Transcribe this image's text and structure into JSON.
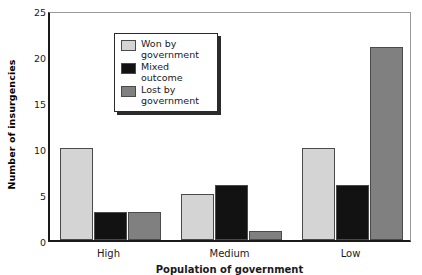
{
  "chart_data": {
    "type": "bar",
    "title": "",
    "xlabel": "Population of government",
    "ylabel": "Number of insurgencies",
    "categories": [
      "High",
      "Medium",
      "Low"
    ],
    "series": [
      {
        "name": "Won by government",
        "values": [
          10,
          5,
          10
        ],
        "color": "#d4d4d4"
      },
      {
        "name": "Mixed outcome",
        "values": [
          3,
          6,
          6
        ],
        "color": "#121212"
      },
      {
        "name": "Lost by government",
        "values": [
          3,
          1,
          21
        ],
        "color": "#808080"
      }
    ],
    "ylim": [
      0,
      25
    ],
    "yticks": [
      0,
      5,
      10,
      15,
      20,
      25
    ],
    "ytick_labels": [
      "0",
      "5",
      "10",
      "15",
      "20",
      "25"
    ],
    "grid": false,
    "legend_position": "upper-center-left"
  },
  "axes": {
    "y_title": "Number of insurgencies",
    "x_title": "Population of government"
  },
  "legend": {
    "items": [
      {
        "label": "Won by government"
      },
      {
        "label": "Mixed outcome"
      },
      {
        "label": "Lost by government"
      }
    ]
  }
}
